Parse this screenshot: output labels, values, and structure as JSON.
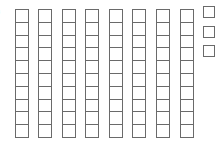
{
  "diagram": {
    "type": "base-ten-blocks",
    "label_fragment": ")",
    "tens_rods": {
      "count": 8,
      "cells_per_rod": 10,
      "left_positions": [
        15,
        38,
        62,
        85,
        109,
        132,
        156,
        180
      ]
    },
    "unit_cubes": {
      "count": 3,
      "top_positions": [
        6,
        26,
        45
      ]
    },
    "represented_value": 83,
    "stroke_color": "#6a6a6a",
    "background_color": "#ffffff"
  }
}
